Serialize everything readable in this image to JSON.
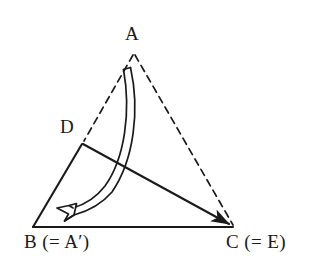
{
  "figure": {
    "type": "geometry-diagram",
    "background_color": "#ffffff",
    "stroke_color": "#1a1a1a",
    "labels": {
      "apex": "A",
      "point_d": "D",
      "bottom_left": "B (= A′)",
      "bottom_left_main": "B",
      "bottom_left_paren": "(=",
      "bottom_left_image": "A′",
      "bottom_right": "C (= E)",
      "bottom_right_main": "C",
      "bottom_right_paren": "(=",
      "bottom_right_image": "E"
    },
    "vertices": {
      "A": {
        "x": 133,
        "y": 52
      },
      "B": {
        "x": 33,
        "y": 227
      },
      "C": {
        "x": 233,
        "y": 227
      },
      "D": {
        "x": 82,
        "y": 143
      }
    },
    "segments": [
      {
        "name": "A-D",
        "from": "A",
        "to": "D",
        "style": "dashed"
      },
      {
        "name": "A-C",
        "from": "A",
        "to": "C",
        "style": "dashed"
      },
      {
        "name": "D-B",
        "from": "D",
        "to": "B",
        "style": "solid"
      },
      {
        "name": "B-C",
        "from": "B",
        "to": "C",
        "style": "solid"
      },
      {
        "name": "D-C",
        "from": "D",
        "to": "C",
        "style": "solid",
        "arrowhead": "filled-at-C"
      }
    ],
    "curved_arrow": {
      "name": "rotation-arrow",
      "style": "hollow-double-line",
      "start": {
        "x": 126,
        "y": 68
      },
      "end": {
        "x": 57,
        "y": 208
      },
      "direction": "clockwise-from-A-to-B",
      "arrowhead": "open-outline"
    }
  }
}
